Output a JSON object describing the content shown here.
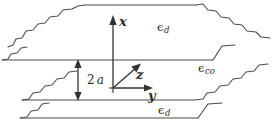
{
  "figure": {
    "width": 272,
    "height": 125,
    "background_color": "#ffffff",
    "line_color": "#4a4a4a",
    "text_color": "#2b2b2b"
  },
  "axes": {
    "origin": {
      "x": 113,
      "y": 88
    },
    "x_axis": {
      "label": "x",
      "direction": "up",
      "tip": {
        "x": 113,
        "y": 17
      }
    },
    "y_axis": {
      "label": "y",
      "direction": "right",
      "tip": {
        "x": 150,
        "y": 88
      }
    },
    "z_axis": {
      "label": "z",
      "direction": "up-right-diagonal",
      "tip": {
        "x": 140,
        "y": 64
      }
    }
  },
  "dimension": {
    "label_value": "2",
    "label_var": "a",
    "arrow_x": 78,
    "arrow_top_y": 60,
    "arrow_bottom_y": 100,
    "description": "core thickness double-headed arrow"
  },
  "regions": [
    {
      "name": "upper-cladding",
      "symbol": "ϵ",
      "subscript": "d",
      "label_x": 157,
      "label_y": 22
    },
    {
      "name": "core",
      "symbol": "ϵ",
      "subscript": "co",
      "label_x": 198,
      "label_y": 63
    },
    {
      "name": "lower-cladding",
      "symbol": "ϵ",
      "subscript": "d",
      "label_x": 158,
      "label_y": 105
    }
  ],
  "boundaries": [
    {
      "name": "upper-interface",
      "y": 60
    },
    {
      "name": "lower-interface",
      "y": 100
    },
    {
      "name": "upper-cladding-top-edge",
      "y": 20
    },
    {
      "name": "lower-cladding-bottom-edge",
      "y": 118
    }
  ]
}
